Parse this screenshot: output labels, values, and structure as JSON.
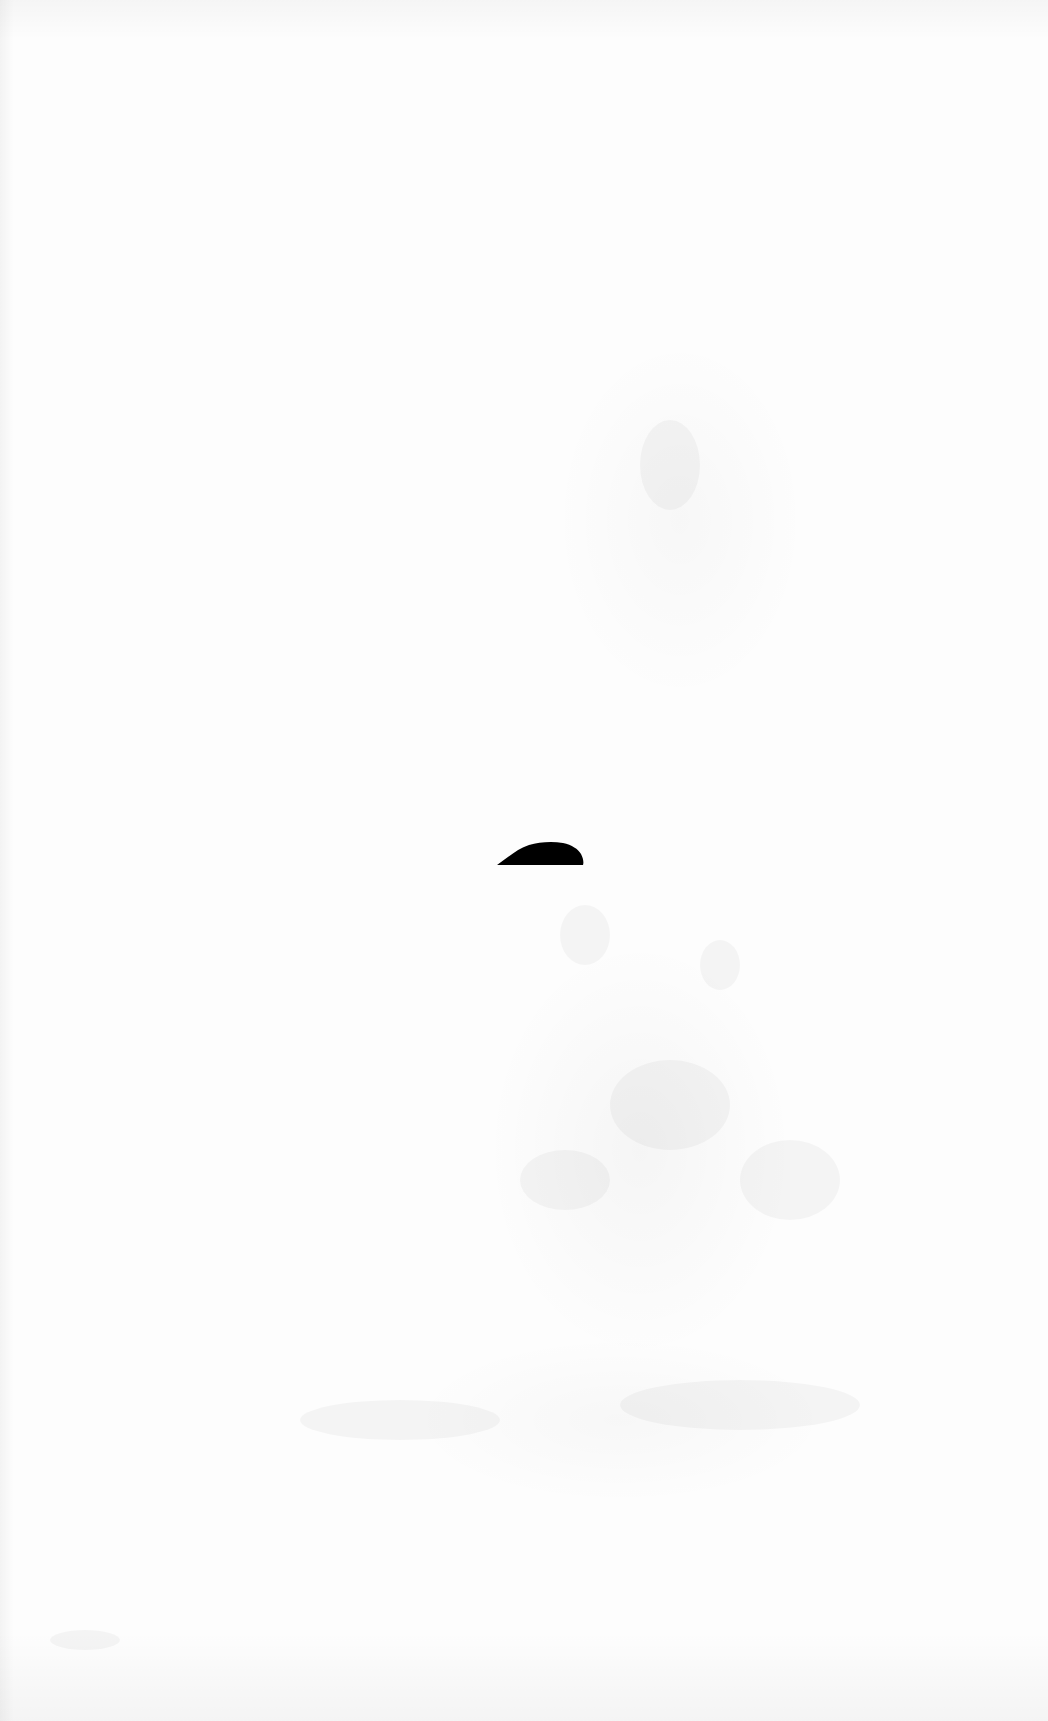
{
  "page": {
    "background_color": "#fdfdfd"
  },
  "ink_mark": {
    "shape": "dome",
    "color": "#000000",
    "x": 497,
    "y": 841,
    "width": 87,
    "height": 25
  }
}
